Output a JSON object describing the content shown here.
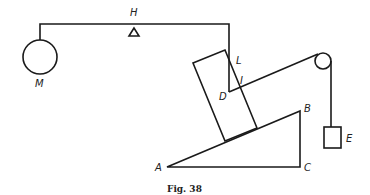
{
  "figure": {
    "caption": "Fig. 38",
    "labels": {
      "M": "M",
      "H": "H",
      "L": "L",
      "D": "D",
      "B": "B",
      "E": "E",
      "A": "A",
      "C": "C",
      "I": "I"
    },
    "components": [
      {
        "id": "M",
        "description": "circular mass hanging from lever arm"
      },
      {
        "id": "H",
        "description": "fulcrum (triangle pivot)"
      },
      {
        "id": "L",
        "description": "lever arm bent downward"
      },
      {
        "id": "D",
        "description": "rectangular block resting on incline"
      },
      {
        "id": "ABC",
        "description": "right-triangle inclined plane, A left, B top right, C bottom right"
      },
      {
        "id": "pulley",
        "description": "pulley at top right"
      },
      {
        "id": "E",
        "description": "hanging weight on rope over pulley"
      }
    ],
    "colors": {
      "stroke": "#1a1a1a",
      "background": "#ffffff"
    }
  }
}
